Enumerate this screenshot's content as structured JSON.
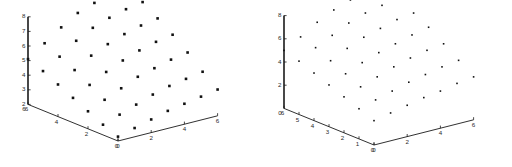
{
  "figure": {
    "background": "#ffffff",
    "marker_color": "#111111",
    "axis_color": "#1a1a1a",
    "panel_count": 2
  },
  "chart_data": [
    {
      "id": "left-panel",
      "type": "scatter",
      "projection": "3d",
      "title": "",
      "xlabel": "",
      "ylabel": "",
      "zlabel": "",
      "grid": false,
      "legend": null,
      "marker": "square",
      "marker_size": 2.6,
      "axes": {
        "x": {
          "label": "",
          "ticks": [
            0,
            2,
            4,
            6
          ],
          "lim": [
            0,
            6
          ],
          "direction": "right-descending"
        },
        "y": {
          "label": "",
          "ticks": [
            6,
            4,
            2,
            0
          ],
          "lim": [
            0,
            6
          ],
          "direction": "left-descending"
        },
        "z": {
          "label": "",
          "ticks": [
            2,
            3,
            4,
            5,
            6,
            7,
            8
          ],
          "lim": [
            2,
            8
          ],
          "direction": "vertical"
        }
      },
      "origin_labels": [
        "0",
        "0"
      ],
      "axis_start_label": "6",
      "x": [
        0,
        1,
        2,
        3,
        4,
        5,
        6,
        0,
        1,
        2,
        3,
        4,
        5,
        6,
        0,
        1,
        2,
        3,
        4,
        5,
        6,
        0,
        1,
        2,
        3,
        4,
        5,
        6,
        0,
        1,
        2,
        3,
        4,
        5,
        6,
        0,
        1,
        2,
        3,
        4,
        5,
        6,
        0,
        1,
        2,
        3,
        4,
        5,
        6
      ],
      "y": [
        0,
        0,
        0,
        0,
        0,
        0,
        0,
        1,
        1,
        1,
        1,
        1,
        1,
        1,
        2,
        2,
        2,
        2,
        2,
        2,
        2,
        3,
        3,
        3,
        3,
        3,
        3,
        3,
        4,
        4,
        4,
        4,
        4,
        4,
        4,
        5,
        5,
        5,
        5,
        5,
        5,
        5,
        6,
        6,
        6,
        6,
        6,
        6,
        6
      ],
      "z": [
        2.3,
        2.6,
        2.9,
        3.2,
        3.4,
        3.6,
        3.8,
        2.7,
        3.1,
        3.5,
        3.9,
        4.2,
        4.4,
        4.6,
        3.2,
        3.7,
        4.2,
        4.7,
        5.0,
        5.3,
        5.5,
        3.7,
        4.3,
        4.9,
        5.4,
        5.8,
        6.1,
        6.3,
        4.2,
        4.9,
        5.6,
        6.1,
        6.5,
        6.8,
        7.0,
        4.7,
        5.4,
        6.2,
        6.8,
        7.2,
        7.5,
        7.7,
        5.1,
        5.9,
        6.7,
        7.4,
        7.8,
        8.0,
        8.2
      ]
    },
    {
      "id": "right-panel",
      "type": "scatter",
      "projection": "3d",
      "title": "",
      "xlabel": "",
      "ylabel": "",
      "zlabel": "",
      "grid": false,
      "legend": null,
      "marker": "square",
      "marker_size": 1.6,
      "axes": {
        "x": {
          "label": "",
          "ticks": [
            0,
            2,
            4,
            6
          ],
          "lim": [
            0,
            6
          ],
          "direction": "right-descending"
        },
        "y": {
          "label": "",
          "ticks": [
            0,
            1,
            2,
            3,
            4,
            5,
            6
          ],
          "lim": [
            0,
            6
          ],
          "direction": "left-descending"
        },
        "z": {
          "label": "",
          "ticks": [
            2,
            4,
            6,
            8
          ],
          "lim": [
            0,
            8
          ],
          "direction": "vertical"
        }
      },
      "origin_labels": [
        "6",
        "0"
      ],
      "axis_start_label": "0",
      "x": [
        0,
        1,
        2,
        3,
        4,
        5,
        6,
        0,
        1,
        2,
        3,
        4,
        5,
        6,
        0,
        1,
        2,
        3,
        4,
        5,
        6,
        0,
        1,
        2,
        3,
        4,
        5,
        6,
        0,
        1,
        2,
        3,
        4,
        5,
        6,
        0,
        1,
        2,
        3,
        4,
        5,
        6,
        0,
        1,
        2,
        3,
        4,
        5,
        6
      ],
      "y": [
        0,
        0,
        0,
        0,
        0,
        0,
        0,
        1,
        1,
        1,
        1,
        1,
        1,
        1,
        2,
        2,
        2,
        2,
        2,
        2,
        2,
        3,
        3,
        3,
        3,
        3,
        3,
        3,
        4,
        4,
        4,
        4,
        4,
        4,
        4,
        5,
        5,
        5,
        5,
        5,
        5,
        5,
        6,
        6,
        6,
        6,
        6,
        6,
        6
      ],
      "z": [
        2.1,
        2.4,
        2.7,
        3.0,
        3.2,
        3.5,
        3.7,
        2.6,
        3.0,
        3.4,
        3.8,
        4.1,
        4.4,
        4.6,
        3.1,
        3.6,
        4.1,
        4.6,
        5.0,
        5.3,
        5.5,
        3.6,
        4.2,
        4.8,
        5.3,
        5.7,
        6.1,
        6.4,
        4.1,
        4.8,
        5.5,
        6.1,
        6.5,
        6.9,
        7.1,
        4.6,
        5.4,
        6.1,
        6.8,
        7.3,
        7.6,
        7.8,
        5.0,
        5.8,
        6.7,
        7.4,
        7.9,
        8.1,
        8.3
      ]
    }
  ]
}
